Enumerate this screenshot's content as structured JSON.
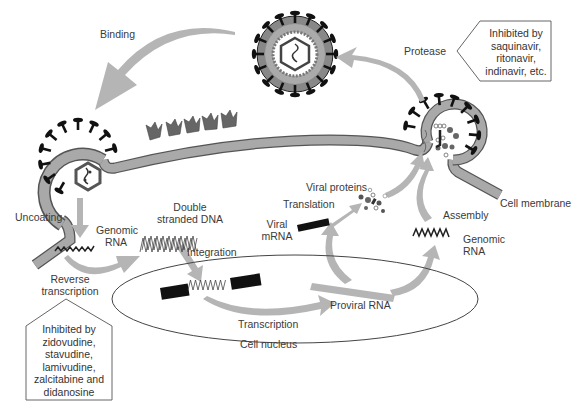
{
  "colors": {
    "arrow": "#b5b5b5",
    "membrane": "#a9a9a9",
    "membrane_outline": "#555555",
    "receptor": "#666666",
    "spike": "#111111",
    "nucleus_outline": "#444444"
  },
  "labels": {
    "binding": "Binding",
    "protease": "Protease",
    "uncoating": "Uncoating",
    "genomic_rna_left": [
      "Genomic",
      "RNA"
    ],
    "double_stranded_dna": [
      "Double",
      "stranded DNA"
    ],
    "integration": "Integration",
    "reverse_transcription": [
      "Reverse",
      "transcription"
    ],
    "viral_proteins": "Viral proteins",
    "translation": "Translation",
    "viral_mrna": [
      "Viral",
      "mRNA"
    ],
    "assembly": "Assembly",
    "genomic_rna_right": [
      "Genomic",
      "RNA"
    ],
    "cell_membrane": "Cell membrane",
    "proviral_rna": "Proviral RNA",
    "transcription": "Transcription",
    "cell_nucleus": "Cell nucleus"
  },
  "callouts": {
    "protease_inhibitors": [
      "Inhibited by",
      "saquinavir,",
      "ritonavir,",
      "indinavir, etc."
    ],
    "rt_inhibitors": [
      "Inhibited by",
      "zidovudine,",
      "stavudine,",
      "lamivudine,",
      "zalcitabine and",
      "didanosine"
    ]
  }
}
